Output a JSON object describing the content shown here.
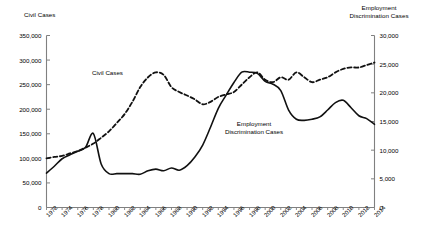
{
  "header": {
    "left_axis_title": "Civil Cases",
    "right_axis_title": "Employment\nDiscrimination Cases"
  },
  "annotations": {
    "civil_label": "Civil Cases",
    "employment_label": "Employment\nDiscrimination Cases"
  },
  "axes": {
    "left_ticks": [
      "350,000",
      "300,000",
      "250,000",
      "200,000",
      "150,000",
      "100,000",
      "50,000",
      "0"
    ],
    "right_ticks": [
      "30,000",
      "25,000",
      "20,000",
      "15,000",
      "10,000",
      "5,000",
      "0"
    ],
    "x_ticks": [
      "1972",
      "1974",
      "1976",
      "1978",
      "1980",
      "1982",
      "1984",
      "1986",
      "1988",
      "1990",
      "1992",
      "1994",
      "1996",
      "1998",
      "2000",
      "2002",
      "2004",
      "2006",
      "2008",
      "2010",
      "2012",
      "2014"
    ]
  },
  "style": {
    "line_color": "#111111",
    "axis_color": "#808080",
    "background": "#ffffff"
  },
  "chart_data": {
    "type": "line",
    "title": "",
    "xlabel": "",
    "ylabel": "Civil Cases",
    "y2label": "Employment Discrimination Cases",
    "grid": false,
    "legend": "inline-annotations",
    "xlim": [
      1972,
      2014
    ],
    "ylim": [
      0,
      350000
    ],
    "y2lim": [
      0,
      30000
    ],
    "x": [
      1972,
      1973,
      1974,
      1975,
      1976,
      1977,
      1978,
      1979,
      1980,
      1981,
      1982,
      1983,
      1984,
      1985,
      1986,
      1987,
      1988,
      1989,
      1990,
      1991,
      1992,
      1993,
      1994,
      1995,
      1996,
      1997,
      1998,
      1999,
      2000,
      2001,
      2002,
      2003,
      2004,
      2005,
      2006,
      2007,
      2008,
      2009,
      2010,
      2011,
      2012,
      2013,
      2014
    ],
    "series": [
      {
        "name": "Civil Cases",
        "axis": "left",
        "style": "dashed",
        "values": [
          100000,
          103000,
          105000,
          110000,
          115000,
          122000,
          130000,
          142000,
          155000,
          172000,
          190000,
          215000,
          245000,
          265000,
          275000,
          270000,
          245000,
          235000,
          228000,
          220000,
          210000,
          215000,
          225000,
          230000,
          235000,
          250000,
          265000,
          275000,
          260000,
          255000,
          265000,
          260000,
          275000,
          265000,
          255000,
          260000,
          265000,
          275000,
          282000,
          285000,
          285000,
          290000,
          295000
        ]
      },
      {
        "name": "Employment Discrimination Cases",
        "axis": "right",
        "style": "solid",
        "values": [
          6000,
          7200,
          8500,
          9200,
          9800,
          10500,
          12900,
          7600,
          5900,
          5900,
          5900,
          5900,
          5800,
          6400,
          6700,
          6400,
          6900,
          6500,
          7300,
          8800,
          10900,
          14000,
          17300,
          19600,
          21800,
          23600,
          23600,
          23400,
          22000,
          21500,
          20400,
          17000,
          15400,
          15200,
          15400,
          15800,
          17000,
          18300,
          18700,
          17400,
          16000,
          15500,
          14500
        ]
      }
    ]
  }
}
